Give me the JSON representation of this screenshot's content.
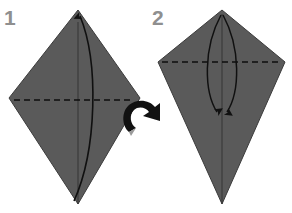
{
  "figure": {
    "background_color": "#ffffff",
    "paper_fill_color": "#5a5a5a",
    "paper_edge_color": "#3d3d3d",
    "crease_line_color": "#111111",
    "fold_line_color": "#111111",
    "step_number_color": "#8f8f8f",
    "width": 292,
    "height": 213
  },
  "steps": [
    {
      "number": "1",
      "label": "step-1",
      "description": "Kite shape with vertical center crease and horizontal dashed valley fold line; curved arrow indicates folding the lower right edge up to the center.",
      "shape": {
        "name": "kite",
        "apex": [
          78,
          10
        ],
        "left": [
          9,
          98
        ],
        "right": [
          140,
          98
        ],
        "bottom": [
          78,
          204
        ]
      },
      "dashed_fold_line": {
        "y": 100,
        "x_start": 14,
        "x_end": 134
      },
      "center_crease": {
        "x": 78,
        "y_start": 22,
        "y_end": 204
      },
      "motion_arrow": {
        "name": "fold-arrow-up",
        "from": [
          72,
          200
        ],
        "to": [
          80,
          14
        ],
        "direction": "up"
      }
    },
    {
      "number": "2",
      "label": "step-2",
      "description": "Kite shape with two symmetric curved arrows from the apex pointing down to the center, and a horizontal dashed valley fold line.",
      "shape": {
        "name": "kite",
        "apex": [
          222,
          10
        ],
        "left": [
          158,
          62
        ],
        "right": [
          285,
          62
        ],
        "bottom": [
          222,
          204
        ]
      },
      "dashed_fold_line": {
        "y": 62,
        "x_start": 162,
        "x_end": 281
      },
      "center_crease": {
        "x": 222,
        "y_start": 14,
        "y_end": 204
      },
      "motion_arrows": [
        {
          "name": "fold-arrow-left-down",
          "from": [
            220,
            14
          ],
          "to": [
            218,
            115
          ],
          "direction": "down"
        },
        {
          "name": "fold-arrow-right-down",
          "from": [
            224,
            14
          ],
          "to": [
            226,
            115
          ],
          "direction": "down"
        }
      ]
    }
  ],
  "transition_arrow": {
    "name": "rotate-arrow",
    "label": "proceed to next step",
    "color": "#111111",
    "position": [
      126,
      99
    ],
    "size": [
      37,
      37
    ]
  }
}
